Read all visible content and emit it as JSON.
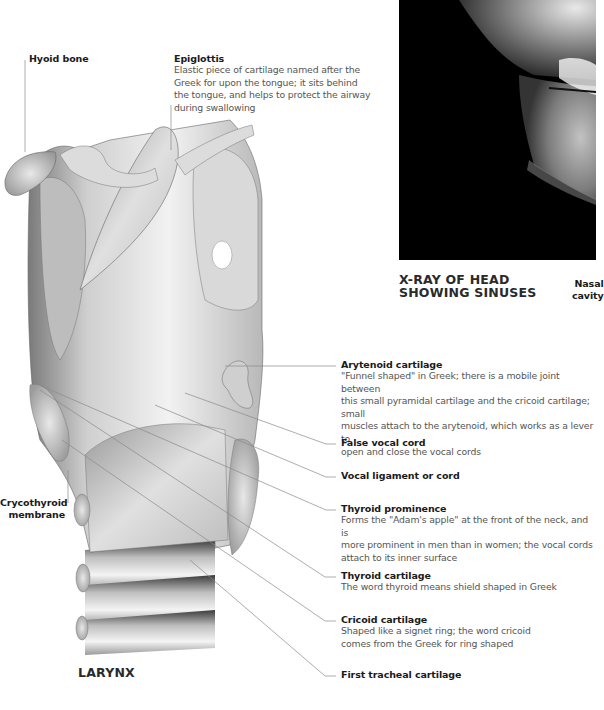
{
  "figure": {
    "larynx_title": "LARYNX",
    "xray_title_line1": "X-RAY OF HEAD",
    "xray_title_line2": "SHOWING SINUSES",
    "xray_side_label_line1": "Nasal",
    "xray_side_label_line2": "cavity"
  },
  "labels": {
    "hyoid": {
      "title": "Hyoid bone"
    },
    "epiglottis": {
      "title": "Epiglottis",
      "body": [
        "Elastic piece of cartilage named after the",
        "Greek for upon the tongue; it sits behind",
        "the tongue, and helps to protect the airway",
        "during swallowing"
      ]
    },
    "crycothyroid": {
      "title_line1": "Crycothyroid",
      "title_line2": "membrane"
    },
    "arytenoid": {
      "title": "Arytenoid cartilage",
      "body": [
        "\"Funnel shaped\" in Greek; there is a mobile joint between",
        "this small pyramidal cartilage and the cricoid cartilage; small",
        "muscles attach to the arytenoid, which works as a lever to",
        "open and close the vocal cords"
      ]
    },
    "false_vocal_cord": {
      "title": "False vocal cord"
    },
    "vocal_ligament": {
      "title": "Vocal ligament or cord"
    },
    "thyroid_prominence": {
      "title": "Thyroid prominence",
      "body": [
        "Forms the \"Adam's apple\" at the front of the neck, and is",
        "more prominent in men than in women; the vocal cords",
        "attach to its inner surface"
      ]
    },
    "thyroid_cartilage": {
      "title": "Thyroid cartilage",
      "body": [
        "The word thyroid means shield shaped in Greek"
      ]
    },
    "cricoid_cartilage": {
      "title": "Cricoid cartilage",
      "body": [
        "Shaped like a signet ring; the word cricoid",
        "comes from the Greek for ring shaped"
      ]
    },
    "first_tracheal": {
      "title": "First tracheal cartilage"
    }
  },
  "colors": {
    "leader_line": "#8a8a8a",
    "title_text": "#1a1a1a",
    "body_text": "#555555",
    "xray_background": "#000000"
  }
}
